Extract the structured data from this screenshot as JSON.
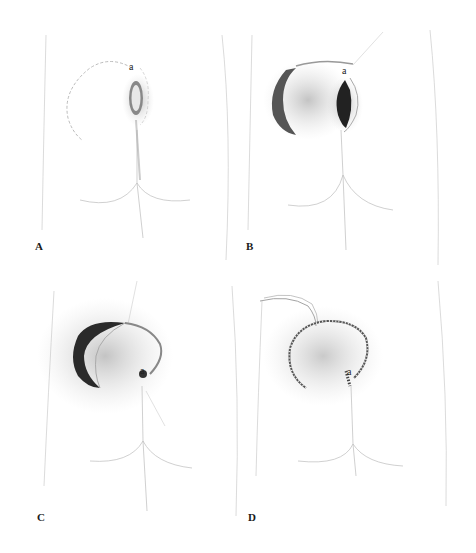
{
  "figure": {
    "panels": [
      {
        "id": "A",
        "label": "A",
        "point_label": "a",
        "description": "Original defect with planned rotation flap outline (dashed)"
      },
      {
        "id": "B",
        "label": "B",
        "point_label": "a",
        "description": "Curved incision made, flap raised"
      },
      {
        "id": "C",
        "label": "C",
        "point_label": "a",
        "description": "Flap rotated into defect"
      },
      {
        "id": "D",
        "label": "D",
        "point_label": "a",
        "description": "Flap sutured in place with drain"
      }
    ]
  },
  "colors": {
    "background": "#ffffff",
    "outline": "#b8b8b8",
    "shadow": "#555555",
    "dark_tissue": "#2a2a2a"
  }
}
